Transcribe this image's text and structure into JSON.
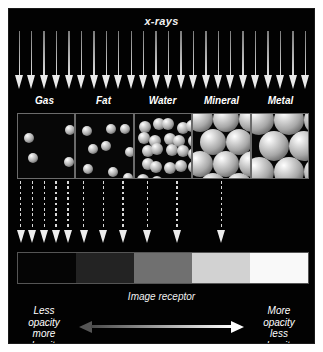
{
  "figure": {
    "title": "x-rays",
    "background_color": "#020202",
    "receptor_label": "Image receptor"
  },
  "materials": [
    {
      "name": "Gas",
      "label": "Gas",
      "sphere_count": 4,
      "sphere_size": 5,
      "packing": "sparse"
    },
    {
      "name": "Fat",
      "label": "Fat",
      "sphere_count": 9,
      "sphere_size": 5,
      "packing": "light"
    },
    {
      "name": "Water",
      "label": "Water",
      "sphere_count": 22,
      "sphere_size": 6,
      "packing": "medium"
    },
    {
      "name": "Mineral",
      "label": "Mineral",
      "sphere_count": 30,
      "sphere_size": 13,
      "packing": "dense"
    },
    {
      "name": "Metal",
      "label": "Metal",
      "sphere_count": 36,
      "sphere_size": 15,
      "packing": "closest"
    }
  ],
  "beam": {
    "incident_arrow_count": 24,
    "incident_color": "#eaeaea",
    "transmitted_arrow_count": 12,
    "transmitted_color": "#ededed",
    "transmitted_per_material": [
      5,
      3,
      2,
      1,
      0
    ],
    "transmitted_style": "dashed"
  },
  "receptor_bands": [
    {
      "material": "Gas",
      "color": "#050505",
      "appearance": "black"
    },
    {
      "material": "Fat",
      "color": "#232323",
      "appearance": "dark gray"
    },
    {
      "material": "Water",
      "color": "#707070",
      "appearance": "mid gray"
    },
    {
      "material": "Mineral",
      "color": "#d2d2d2",
      "appearance": "light gray"
    },
    {
      "material": "Metal",
      "color": "#f9f9f9",
      "appearance": "white"
    }
  ],
  "legend": {
    "left_lines": [
      "Less",
      "opacity",
      "more",
      "density"
    ],
    "right_lines": [
      "More",
      "opacity",
      "less",
      "density"
    ],
    "arrow_left_color": "#555555",
    "arrow_right_color": "#ffffff"
  }
}
